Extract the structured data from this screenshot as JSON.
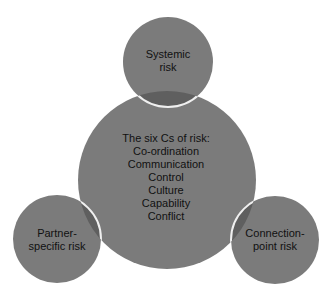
{
  "diagram": {
    "type": "venn-cluster",
    "colors": {
      "background": "#ffffff",
      "circle_fill": "#7b7b7b",
      "overlap_fill": "#5f5f5f",
      "separator": "#efefef",
      "text": "#111111"
    },
    "center": {
      "title": "The six Cs of risk:",
      "items": [
        "Co-ordination",
        "Communication",
        "Control",
        "Culture",
        "Capability",
        "Conflict"
      ]
    },
    "top": {
      "lines": [
        "Systemic",
        "risk"
      ]
    },
    "left": {
      "lines": [
        "Partner-",
        "specific risk"
      ]
    },
    "right": {
      "lines": [
        "Connection-",
        "point risk"
      ]
    }
  }
}
